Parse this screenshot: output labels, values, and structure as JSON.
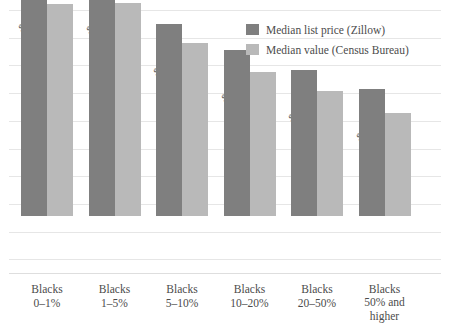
{
  "chart_data": {
    "type": "bar",
    "title": "",
    "xlabel": "",
    "ylabel": "",
    "grid": true,
    "legend_position": "top-right",
    "ylim": [
      0,
      380
    ],
    "categories": [
      "Blacks 0–1%",
      "Blacks 1–5%",
      "Blacks 5–10%",
      "Blacks 10–20%",
      "Blacks 20–50%",
      "Blacks 50% and higher"
    ],
    "category_lines": [
      [
        "Blacks",
        "0–1%"
      ],
      [
        "Blacks",
        "1–5%"
      ],
      [
        "Blacks",
        "5–10%"
      ],
      [
        "Blacks",
        "10–20%"
      ],
      [
        "Blacks",
        "20–50%"
      ],
      [
        "Blacks",
        "50% and",
        "higher"
      ]
    ],
    "series": [
      {
        "name": "Median list price (Zillow)",
        "color": "#7f7f7f",
        "values": [
          341,
          338,
          278,
          240,
          211,
          184
        ],
        "labels": [
          "$341K",
          "$338K",
          "$278K",
          "$240K",
          "$211K",
          "$184K"
        ]
      },
      {
        "name": "Median value (Census Bureau)",
        "color": "#b9b9b9",
        "values": [
          307,
          308,
          250,
          208,
          181,
          149
        ],
        "labels": [
          "$307K",
          "$308K",
          "$250K",
          "$208K",
          "$181K",
          "$149K"
        ]
      }
    ],
    "units": "thousands of US dollars"
  },
  "legend": {
    "items": [
      {
        "label": "Median list price (Zillow)",
        "color": "#7f7f7f"
      },
      {
        "label": "Median value (Census Bureau)",
        "color": "#b9b9b9"
      }
    ]
  }
}
